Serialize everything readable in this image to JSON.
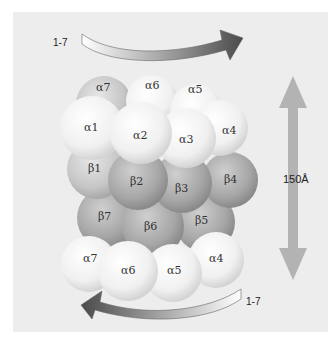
{
  "diagram": {
    "title": "",
    "rotation_top": {
      "label": "1-7",
      "direction": "clockwise"
    },
    "rotation_bottom": {
      "label": "1-7",
      "direction": "counter-clockwise"
    },
    "dimension": {
      "label": "150Å"
    },
    "rings": {
      "alpha_top_back": [
        "α7",
        "α6",
        "α5"
      ],
      "alpha_top_front": [
        "α1",
        "α2",
        "α3",
        "α4"
      ],
      "beta_upper": [
        "β1",
        "β2",
        "β3",
        "β4"
      ],
      "beta_lower": [
        "β7",
        "β6",
        "β5"
      ],
      "alpha_bottom": [
        "α7",
        "α6",
        "α5",
        "α4"
      ]
    },
    "colors": {
      "panel_bg": "#ededed",
      "alpha_light": "#f4f4f4",
      "alpha_back": "#c8c8c8",
      "beta": "#a9a9a9",
      "arrow_dark": "#555555",
      "dimension_arrow": "#b3b3b3"
    }
  }
}
